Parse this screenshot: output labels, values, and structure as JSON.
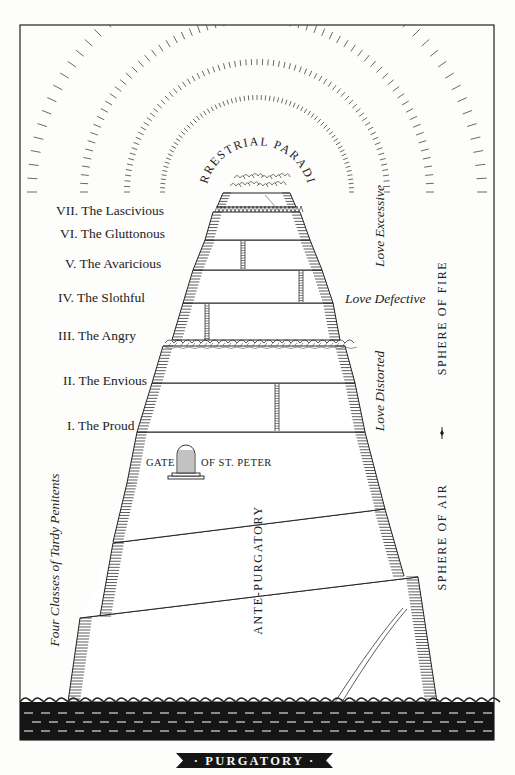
{
  "title": "PURGATORY",
  "banner": {
    "label": "· PURGATORY ·",
    "bg_color": "#151515"
  },
  "summit": {
    "label": "TERRESTRIAL PARADISE"
  },
  "terraces": [
    {
      "numeral": "VII.",
      "name": "The Lascivious",
      "label": "VII. The Lascivious"
    },
    {
      "numeral": "VI.",
      "name": "The Gluttonous",
      "label": "VI. The Gluttonous"
    },
    {
      "numeral": "V.",
      "name": "The Avaricious",
      "label": "V. The Avaricious"
    },
    {
      "numeral": "IV.",
      "name": "The Slothful",
      "label": "IV. The Slothful"
    },
    {
      "numeral": "III.",
      "name": "The Angry",
      "label": "III. The Angry"
    },
    {
      "numeral": "II.",
      "name": "The Envious",
      "label": "II. The Envious"
    },
    {
      "numeral": "I.",
      "name": "The Proud",
      "label": "I. The Proud"
    }
  ],
  "love_labels": {
    "excessive": "Love Excessive",
    "defective": "Love Defective",
    "distorted": "Love Distorted"
  },
  "gate": {
    "left": "GATE",
    "right": "OF ST. PETER"
  },
  "ante_purgatory": {
    "label": "ANTE-PURGATORY"
  },
  "tardy_penitents": {
    "label": "Four Classes of Tardy Penitents"
  },
  "spheres": {
    "fire": "SPHERE OF FIRE",
    "air": "SPHERE OF AIR"
  },
  "colors": {
    "ink": "#222222",
    "paper": "#fdfdfb",
    "sea": "#151515"
  }
}
